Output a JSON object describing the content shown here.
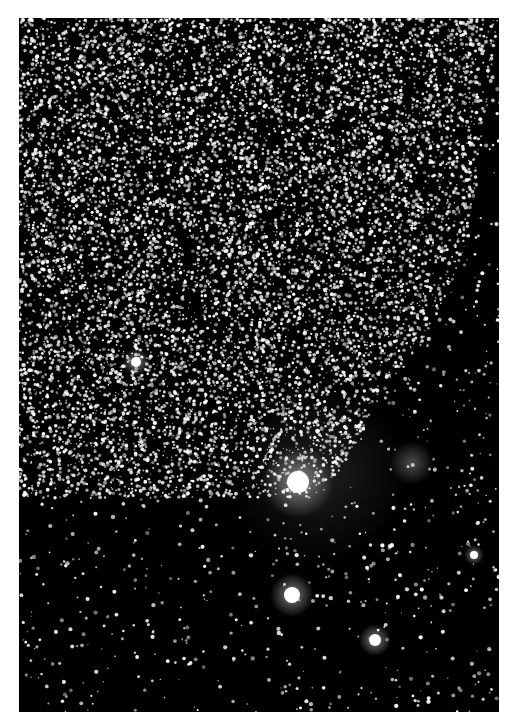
{
  "image": {
    "description": "Astronomical photograph of a dense star field with bright stars and faint nebulosity",
    "background_color": "#ffffff",
    "frame": {
      "x": 19,
      "y": 18,
      "width": 480,
      "height": 694
    },
    "sky_color": "#000000",
    "star_color": "#ffffff"
  },
  "field": {
    "seed": 1337,
    "dense_region": {
      "star_count": 9000,
      "boundary": [
        [
          0,
          0
        ],
        [
          480,
          0
        ],
        [
          470,
          60
        ],
        [
          455,
          200
        ],
        [
          440,
          250
        ],
        [
          400,
          330
        ],
        [
          360,
          380
        ],
        [
          330,
          440
        ],
        [
          300,
          480
        ],
        [
          0,
          480
        ]
      ]
    },
    "sparse_star_count": 1500
  },
  "bright_stars": [
    {
      "name": "central-bright-star",
      "x": 279,
      "y": 464,
      "radius": 11,
      "glow": 36
    },
    {
      "name": "lower-bright-star",
      "x": 273,
      "y": 577,
      "radius": 8,
      "glow": 22
    },
    {
      "name": "bottom-right-star",
      "x": 356,
      "y": 622,
      "radius": 6,
      "glow": 16
    },
    {
      "name": "left-bright-star",
      "x": 117,
      "y": 344,
      "radius": 5,
      "glow": 14
    },
    {
      "name": "right-small-star",
      "x": 455,
      "y": 537,
      "radius": 4,
      "glow": 10
    }
  ],
  "nebulae": [
    {
      "name": "central-nebulosity",
      "x": 300,
      "y": 455,
      "radius": 90,
      "opacity": 0.12
    },
    {
      "name": "right-nebula",
      "x": 393,
      "y": 445,
      "radius": 22,
      "opacity": 0.3
    }
  ]
}
